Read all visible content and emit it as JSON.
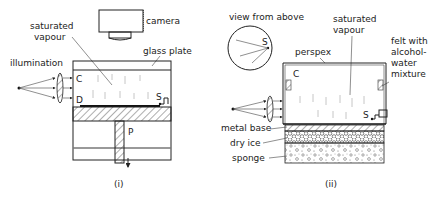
{
  "figure_i": {
    "caption": "(i)",
    "labels": {
      "camera": "camera",
      "saturated_vapour": "saturated vapour",
      "saturated_vapour_line1": "saturated",
      "saturated_vapour_line2": "vapour",
      "glass_plate": "glass plate",
      "illumination": "illumination",
      "C": "C",
      "D": "D",
      "S": "S",
      "P": "P"
    }
  },
  "figure_ii": {
    "caption": "(ii)",
    "labels": {
      "view_from_above": "view from above",
      "S_top": "S",
      "saturated_vapour_line1": "saturated",
      "saturated_vapour_line2": "vapour",
      "perspex": "perspex",
      "felt_line1": "felt with",
      "felt_line2": "alcohol-",
      "felt_line3": "water",
      "felt_line4": "mixture",
      "C": "C",
      "S": "S",
      "metal_base": "metal base",
      "dry_ice": "dry ice",
      "sponge": "sponge"
    }
  }
}
